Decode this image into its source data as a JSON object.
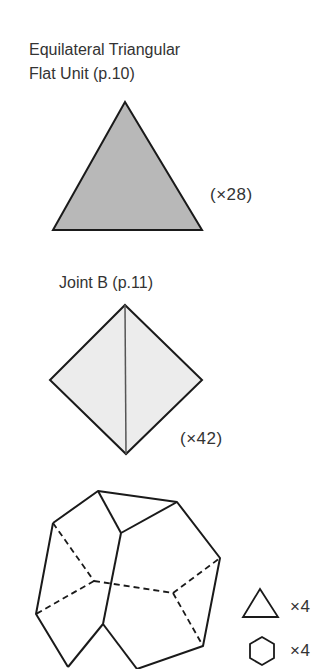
{
  "sections": [
    {
      "title_lines": [
        "Equilateral Triangular",
        "Flat Unit (p.10)"
      ],
      "shape": "triangle",
      "fill": "#b8b8b8",
      "count_label": "(×28)"
    },
    {
      "title": "Joint B (p.11)",
      "shape": "diamond",
      "fill": "#ececec",
      "count_label": "(×42)"
    },
    {
      "shape": "truncated-tetrahedron",
      "legend": [
        {
          "icon": "triangle",
          "label": "×4"
        },
        {
          "icon": "hexagon",
          "label": "×4"
        }
      ]
    }
  ],
  "colors": {
    "stroke": "#1a1a1a",
    "text": "#333333"
  }
}
